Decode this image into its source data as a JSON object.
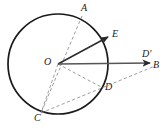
{
  "figure": {
    "background_color": "#ffffff",
    "stroke_color": "#1a1a1a",
    "dashed_color": "#8a8a8a",
    "solid_color": "#3a3a3a"
  },
  "circle": {
    "center_label": "O",
    "cx": 58,
    "cy": 64,
    "r": 50,
    "stroke_width": 1.6
  },
  "points": [
    {
      "id": "A",
      "label": "A",
      "x": 82,
      "y": 16,
      "label_x": 81,
      "label_y": 3,
      "on_circle": true
    },
    {
      "id": "E",
      "label": "E",
      "x": 110,
      "y": 36,
      "label_x": 112,
      "label_y": 30,
      "on_circle": false
    },
    {
      "id": "O",
      "label": "O",
      "x": 58,
      "y": 64,
      "label_x": 45,
      "label_y": 57,
      "on_circle": false
    },
    {
      "id": "Dp",
      "label": "D'",
      "x": 148,
      "y": 60,
      "label_x": 143,
      "label_y": 50,
      "on_circle": false
    },
    {
      "id": "B",
      "label": "B",
      "x": 155,
      "y": 67,
      "label_x": 153,
      "label_y": 61,
      "on_circle": false
    },
    {
      "id": "D",
      "label": "D",
      "x": 103,
      "y": 88,
      "label_x": 105,
      "label_y": 82,
      "on_circle": true
    },
    {
      "id": "C",
      "label": "C",
      "x": 41,
      "y": 113,
      "label_x": 35,
      "label_y": 113,
      "on_circle": true
    }
  ],
  "segments": [
    {
      "id": "ray-OE",
      "name": "radius-to-E",
      "from": "O",
      "to": "E",
      "style": "solid",
      "arrow": true,
      "width": 1.5
    },
    {
      "id": "ray-OB",
      "name": "horizontal-ray-OB",
      "from": "O",
      "to": "B",
      "style": "solid",
      "arrow": true,
      "width": 1.5
    },
    {
      "id": "chord-AC",
      "name": "diameter-AC",
      "from": "A",
      "to": "C",
      "style": "dashed",
      "arrow": false,
      "width": 0.9
    },
    {
      "id": "seg-OD",
      "name": "radius-OD",
      "from": "O",
      "to": "D",
      "style": "dashed",
      "arrow": false,
      "width": 0.9
    },
    {
      "id": "seg-OC",
      "name": "radius-OC",
      "from": "O",
      "to": "C",
      "style": "dashed",
      "arrow": false,
      "width": 0.9
    },
    {
      "id": "line-CB",
      "name": "secant-C-through-D-to-B",
      "from": "C",
      "to": "B",
      "style": "dashed",
      "arrow": false,
      "width": 0.9
    }
  ],
  "labels": {
    "A": "A",
    "E": "E",
    "O": "O",
    "D_prime": "D'",
    "B": "B",
    "D": "D",
    "C": "C"
  }
}
